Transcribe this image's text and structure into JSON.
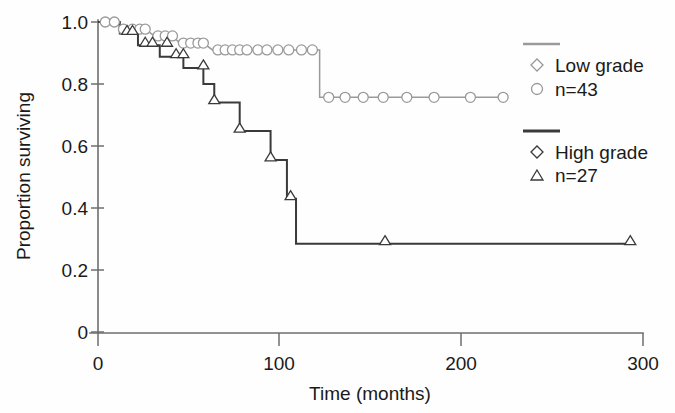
{
  "chart_data": {
    "type": "line",
    "title": "",
    "subtitle": "",
    "xlabel": "Time (months)",
    "ylabel": "Proportion surviving",
    "xlim": [
      0,
      300
    ],
    "ylim": [
      0,
      1.0
    ],
    "xticks": [
      0,
      100,
      200,
      300
    ],
    "xtick_labels": [
      "0",
      "100",
      "200",
      "300"
    ],
    "yticks": [
      0,
      0.2,
      0.4,
      0.6,
      0.8,
      1.0
    ],
    "ytick_labels": [
      "0",
      "0.2",
      "0.4",
      "0.6",
      "0.8",
      "1.0"
    ],
    "grid": false,
    "legend_position": "right",
    "series": [
      {
        "name": "Low grade",
        "n_label": "n=43",
        "n": 43,
        "color": "#9a9a9a",
        "marker": "circle",
        "legend_marker": "diamond",
        "steps": [
          [
            0,
            1.0
          ],
          [
            9,
            1.0
          ],
          [
            14,
            0.977
          ],
          [
            26,
            0.977
          ],
          [
            31,
            0.955
          ],
          [
            41,
            0.955
          ],
          [
            45,
            0.932
          ],
          [
            58,
            0.932
          ],
          [
            63,
            0.91
          ],
          [
            122,
            0.91
          ],
          [
            122,
            0.757
          ],
          [
            223,
            0.757
          ]
        ],
        "censored": [
          [
            4,
            1.0
          ],
          [
            9,
            1.0
          ],
          [
            14,
            0.977
          ],
          [
            19,
            0.977
          ],
          [
            23,
            0.977
          ],
          [
            26,
            0.977
          ],
          [
            33,
            0.955
          ],
          [
            37,
            0.955
          ],
          [
            41,
            0.955
          ],
          [
            47,
            0.932
          ],
          [
            51,
            0.932
          ],
          [
            55,
            0.932
          ],
          [
            58,
            0.932
          ],
          [
            66,
            0.91
          ],
          [
            70,
            0.91
          ],
          [
            74,
            0.91
          ],
          [
            78,
            0.91
          ],
          [
            82,
            0.91
          ],
          [
            88,
            0.91
          ],
          [
            93,
            0.91
          ],
          [
            99,
            0.91
          ],
          [
            105,
            0.91
          ],
          [
            112,
            0.91
          ],
          [
            118,
            0.91
          ],
          [
            127,
            0.757
          ],
          [
            136,
            0.757
          ],
          [
            146,
            0.757
          ],
          [
            157,
            0.757
          ],
          [
            170,
            0.757
          ],
          [
            185,
            0.757
          ],
          [
            205,
            0.757
          ],
          [
            223,
            0.757
          ]
        ]
      },
      {
        "name": "High grade",
        "n_label": "n=27",
        "n": 27,
        "color": "#3a3a3a",
        "marker": "triangle",
        "legend_marker": "diamond",
        "steps": [
          [
            0,
            1.0
          ],
          [
            12,
            1.0
          ],
          [
            12,
            0.963
          ],
          [
            22,
            0.963
          ],
          [
            22,
            0.925
          ],
          [
            34,
            0.925
          ],
          [
            34,
            0.888
          ],
          [
            47,
            0.888
          ],
          [
            47,
            0.852
          ],
          [
            58,
            0.852
          ],
          [
            58,
            0.8
          ],
          [
            64,
            0.8
          ],
          [
            64,
            0.74
          ],
          [
            78,
            0.74
          ],
          [
            78,
            0.648
          ],
          [
            95,
            0.648
          ],
          [
            95,
            0.555
          ],
          [
            104,
            0.555
          ],
          [
            104,
            0.43
          ],
          [
            109,
            0.43
          ],
          [
            109,
            0.285
          ],
          [
            293,
            0.285
          ]
        ],
        "censored": [
          [
            16,
            0.963
          ],
          [
            19,
            0.963
          ],
          [
            26,
            0.925
          ],
          [
            30,
            0.925
          ],
          [
            38,
            0.925
          ],
          [
            43,
            0.888
          ],
          [
            47,
            0.888
          ],
          [
            58,
            0.852
          ],
          [
            64,
            0.74
          ],
          [
            78,
            0.648
          ],
          [
            95,
            0.555
          ],
          [
            106,
            0.43
          ],
          [
            158,
            0.285
          ],
          [
            293,
            0.285
          ]
        ]
      }
    ],
    "annotations": []
  },
  "legend": {
    "entries": [
      {
        "rule": "line-sample-low-grade",
        "marker": "diamond-icon",
        "label": "Low grade",
        "count_marker": "circle-icon",
        "count_label": "n=43"
      },
      {
        "rule": "line-sample-high-grade",
        "marker": "diamond-icon",
        "label": "High grade",
        "count_marker": "triangle-icon",
        "count_label": "n=27"
      }
    ]
  },
  "colors": {
    "low_grade": "#9a9a9a",
    "high_grade": "#3a3a3a",
    "axis": "#6e6e6e",
    "text": "#1a1a1a",
    "background": "#fefefe"
  }
}
